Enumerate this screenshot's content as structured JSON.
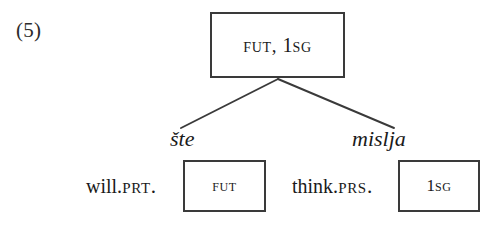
{
  "example": {
    "number_label": "(5)"
  },
  "tree": {
    "root": {
      "box_text_full": "FUT, 1SG",
      "features": [
        "FUT",
        "1SG"
      ],
      "separator": ", "
    },
    "branches": [
      {
        "name": "left",
        "word_form": "šte",
        "gloss": "will.PRT.",
        "gloss_stem": "will.",
        "gloss_abbrev": "PRT.",
        "box_text": "FUT"
      },
      {
        "name": "right",
        "word_form": "mislja",
        "gloss": "think.PRS.",
        "gloss_stem": "think.",
        "gloss_abbrev": "PRS.",
        "box_text": "1SG"
      }
    ]
  },
  "style": {
    "background": "#ffffff",
    "ink": "#1a1a1a",
    "box_border": "#3a3a3a",
    "line_color": "#3a3a3a"
  }
}
